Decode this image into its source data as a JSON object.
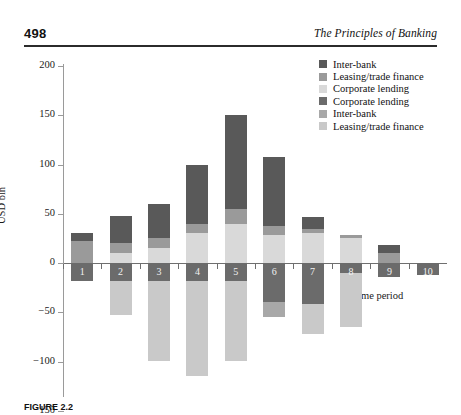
{
  "header": {
    "folio": "498",
    "running_head": "The Principles of Banking"
  },
  "caption": "FIGURE 2.2",
  "chart_data": {
    "type": "bar",
    "subtype": "stacked-diverging",
    "title": "",
    "xlabel": "Time period",
    "ylabel": "USD bln",
    "ylim": [
      -150,
      200
    ],
    "yticks": [
      200,
      150,
      100,
      50,
      0,
      -50,
      -100,
      -150
    ],
    "ytick_labels": [
      "200",
      "150",
      "100",
      "50",
      "0",
      "−50",
      "−100",
      "−150"
    ],
    "grid": false,
    "legend_position": "top-right",
    "categories": [
      "1",
      "2",
      "3",
      "4",
      "5",
      "6",
      "7",
      "8",
      "9",
      "10"
    ],
    "legend": [
      {
        "label": "Inter-bank",
        "color": "#595959"
      },
      {
        "label": "Leasing/trade finance",
        "color": "#9a9a9a"
      },
      {
        "label": "Corporate lending",
        "color": "#d9d9d9"
      },
      {
        "label": "Corporate lending",
        "color": "#6b6b6b"
      },
      {
        "label": "Inter-bank",
        "color": "#a8a8a8"
      },
      {
        "label": "Leasing/trade finance",
        "color": "#c9c9c9"
      }
    ],
    "series": [
      {
        "name": "Inter-bank",
        "side": "positive",
        "color": "#595959",
        "values": [
          8,
          28,
          35,
          60,
          95,
          70,
          12,
          0,
          8,
          0
        ]
      },
      {
        "name": "Leasing/trade finance",
        "side": "positive",
        "color": "#9a9a9a",
        "values": [
          22,
          10,
          10,
          10,
          15,
          10,
          5,
          3,
          10,
          0
        ]
      },
      {
        "name": "Corporate lending",
        "side": "positive",
        "color": "#d9d9d9",
        "values": [
          0,
          10,
          15,
          30,
          40,
          28,
          30,
          25,
          0,
          0
        ]
      },
      {
        "name": "Corporate lending",
        "side": "negative",
        "color": "#6b6b6b",
        "values": [
          -18,
          -18,
          -18,
          -18,
          -18,
          -40,
          -42,
          -10,
          -14,
          -12
        ]
      },
      {
        "name": "Inter-bank",
        "side": "negative",
        "color": "#a8a8a8",
        "values": [
          0,
          0,
          0,
          0,
          0,
          -15,
          0,
          0,
          0,
          0
        ]
      },
      {
        "name": "Leasing/trade finance",
        "side": "negative",
        "color": "#c9c9c9",
        "values": [
          0,
          -35,
          -82,
          -97,
          -82,
          0,
          -30,
          -55,
          0,
          0
        ]
      }
    ],
    "bar_totals_positive": [
      30,
      48,
      60,
      100,
      150,
      108,
      47,
      28,
      18,
      0
    ],
    "bar_totals_negative": [
      -18,
      -53,
      -100,
      -115,
      -100,
      -55,
      -72,
      -65,
      -14,
      -12
    ]
  }
}
